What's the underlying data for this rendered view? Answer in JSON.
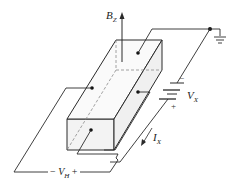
{
  "figure": {
    "labels": {
      "magnetic_field": {
        "main": "B",
        "sub": "Z"
      },
      "applied_voltage": {
        "main": "V",
        "sub": "X"
      },
      "current": {
        "main": "I",
        "sub": "X"
      },
      "hall_voltage": {
        "prefix": "− ",
        "main": "V",
        "sub": "H",
        "suffix": " +"
      },
      "battery_minus": "−",
      "battery_plus": "+"
    },
    "colors": {
      "line": "#2a2a2a",
      "hidden_line": "#8a8a8a",
      "box_face": "#f4f4f4"
    }
  }
}
